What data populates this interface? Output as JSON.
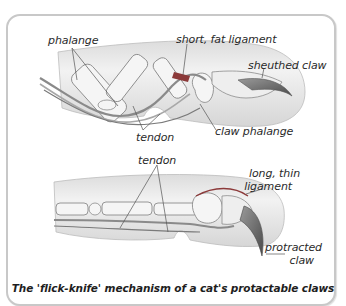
{
  "figure": {
    "caption": "The 'flick-knife' mechanism of a cat's protactable claws",
    "colors": {
      "frame_border": "#c8c8c8",
      "skin_fill": "#ececec",
      "skin_shadow": "#cfcfcf",
      "bone_fill": "#f4f4f4",
      "tendon": "#8a8a8a",
      "ligament_accent": "#b03030",
      "claw": "#6a6a6a",
      "leader_line": "#555555",
      "text": "#2a2a2a"
    }
  },
  "retracted_view": {
    "name": "Sheathed (retracted) claw",
    "labels": {
      "phalange": "phalange",
      "short_fat_ligament": "short, fat ligament",
      "sheathed_claw": "sheuthed claw",
      "tendon": "tendon",
      "claw_phalange": "claw phalange"
    }
  },
  "protracted_view": {
    "name": "Protracted (extended) claw",
    "labels": {
      "tendon": "tendon",
      "long_thin_ligament_1": "long, thin",
      "long_thin_ligament_2": "ligament",
      "protracted_claw_1": "protracted",
      "protracted_claw_2": "claw"
    }
  }
}
